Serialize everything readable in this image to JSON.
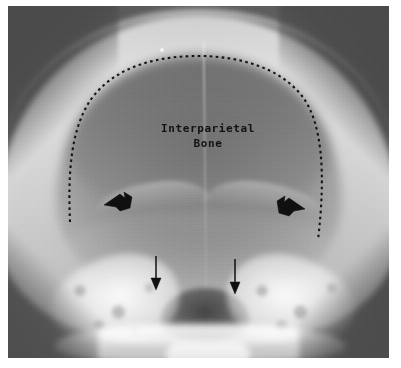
{
  "figure": {
    "kind": "radiograph",
    "view": "Towne / occipital skull radiograph",
    "background_color": "#5c5c5c",
    "frame_color": "#ffffff",
    "annotation_color": "#111111"
  },
  "annotations": {
    "label": {
      "line1": "Interparietal",
      "line2": "Bone",
      "color": "#111111"
    },
    "dotted_outline": {
      "name": "interparietal-bone-outline",
      "style": "dotted-arc",
      "color": "#141414"
    },
    "thick_arrows": [
      {
        "name": "left-thick-arrowhead",
        "x": 112,
        "y": 196,
        "direction": "left"
      },
      {
        "name": "right-thick-arrowhead",
        "x": 285,
        "y": 201,
        "direction": "right"
      }
    ],
    "thin_arrows": [
      {
        "name": "left-thin-arrow",
        "x": 156,
        "y": 252,
        "direction": "down"
      },
      {
        "name": "right-thin-arrow",
        "x": 235,
        "y": 256,
        "direction": "down"
      }
    ]
  },
  "anatomy": {
    "structures": [
      "cranial-vault",
      "occipital-squama",
      "interparietal-bone",
      "transverse-sinus-ridge",
      "foramen-magnum",
      "petrous-temporal-bone",
      "mastoid-air-cells",
      "cervical-spine"
    ]
  }
}
